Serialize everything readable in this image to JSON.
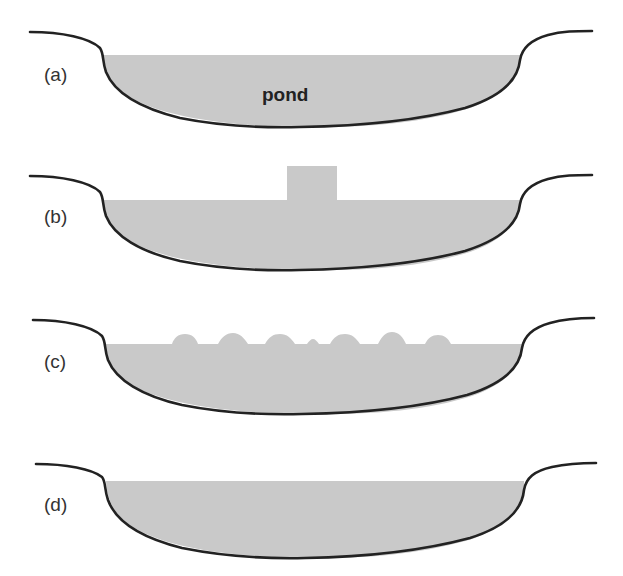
{
  "figure": {
    "colors": {
      "water": "#c9c9c9",
      "outline": "#222222",
      "background": "#ffffff"
    },
    "pond_label": "pond",
    "panels": [
      {
        "id": "a",
        "label": "(a)",
        "state": "flat-surface-with-label"
      },
      {
        "id": "b",
        "label": "(b)",
        "state": "raised-column"
      },
      {
        "id": "c",
        "label": "(c)",
        "state": "surface-waves"
      },
      {
        "id": "d",
        "label": "(d)",
        "state": "flat-surface"
      }
    ]
  }
}
